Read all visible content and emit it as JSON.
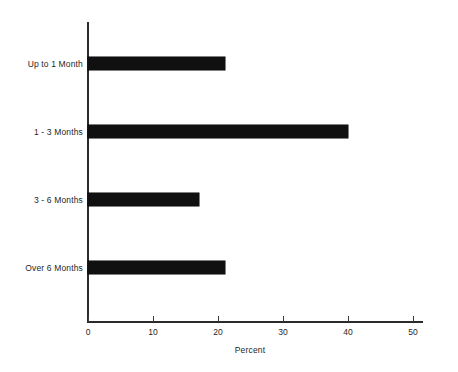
{
  "chart_data": {
    "type": "bar",
    "orientation": "horizontal",
    "title": "",
    "subtitle": "",
    "categories": [
      "Up to 1 Month",
      "1 - 3 Months",
      "3 - 6 Months",
      "Over 6 Months"
    ],
    "values": [
      21,
      40,
      17,
      21
    ],
    "series": [
      {
        "name": "Percent",
        "values": [
          21,
          40,
          17,
          21
        ]
      }
    ],
    "xlabel": "Percent",
    "ylabel": "",
    "xlim": [
      0,
      50
    ],
    "xticks": [
      0,
      10,
      20,
      30,
      40,
      50
    ],
    "xtick_labels": [
      "0",
      "10",
      "20",
      "30",
      "40",
      "50"
    ],
    "grid": false,
    "legend": false,
    "legend_position": "none",
    "bar_color": "#101010",
    "background_color": "#ffffff",
    "axis_color": "#2b2b2b"
  }
}
